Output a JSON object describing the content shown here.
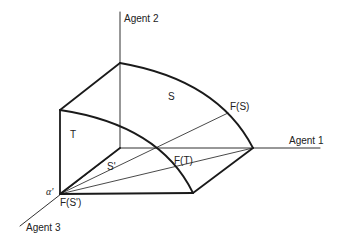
{
  "diagram": {
    "axes": {
      "agent1": "Agent 1",
      "agent2": "Agent 2",
      "agent3": "Agent 3"
    },
    "regions": {
      "S": "S",
      "T": "T",
      "S_prime": "S'"
    },
    "points": {
      "F_S": "F(S)",
      "F_T": "F(T)",
      "F_S_prime": "F(S')",
      "alpha_prime": "α'"
    },
    "colors": {
      "line": "#1a1a1a",
      "background": "#ffffff"
    }
  }
}
